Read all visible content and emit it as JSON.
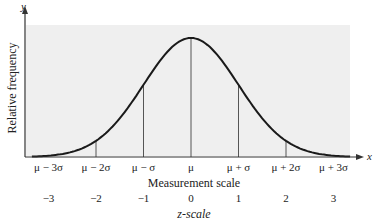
{
  "chart_data": {
    "type": "line",
    "title": "",
    "xlabel": "Measurement scale",
    "x2label": "z-scale",
    "ylabel": "Relative frequency",
    "x_axis_symbol": "x",
    "y_axis_symbol": "y",
    "measurement_ticks": [
      "μ − 3σ",
      "μ − 2σ",
      "μ − σ",
      "μ",
      "μ + σ",
      "μ + 2σ",
      "μ + 3σ"
    ],
    "z_ticks": [
      "−3",
      "−2",
      "−1",
      "0",
      "1",
      "2",
      "3"
    ],
    "z_values": [
      -3,
      -2,
      -1,
      0,
      1,
      2,
      3
    ],
    "vertical_lines_at_z": [
      -2,
      -1,
      0,
      1,
      2
    ],
    "curve": "standard normal density",
    "series": [
      {
        "name": "Normal curve",
        "x": [
          -3,
          -2,
          -1,
          0,
          1,
          2,
          3
        ],
        "values": [
          0.0044,
          0.054,
          0.242,
          0.399,
          0.242,
          0.054,
          0.0044
        ]
      }
    ],
    "grid": false,
    "legend": null
  },
  "colors": {
    "plot_background": "#efefef",
    "curve": "#1a1a1a",
    "lines": "#555555"
  }
}
